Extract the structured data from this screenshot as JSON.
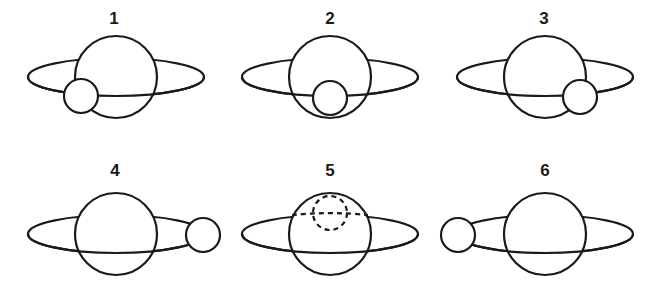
{
  "diagram": {
    "colors": {
      "line": "#1a1a1a",
      "background": "#ffffff"
    },
    "panels": [
      {
        "label": "1",
        "moon_position": "front-lower-left",
        "moon_visible": true
      },
      {
        "label": "2",
        "moon_position": "front-center",
        "moon_visible": true
      },
      {
        "label": "3",
        "moon_position": "front-lower-right",
        "moon_visible": true
      },
      {
        "label": "4",
        "moon_position": "right-edge",
        "moon_visible": true
      },
      {
        "label": "5",
        "moon_position": "behind-planet",
        "moon_visible": false,
        "moon_style": "dashed"
      },
      {
        "label": "6",
        "moon_position": "left-edge",
        "moon_visible": true
      }
    ]
  }
}
